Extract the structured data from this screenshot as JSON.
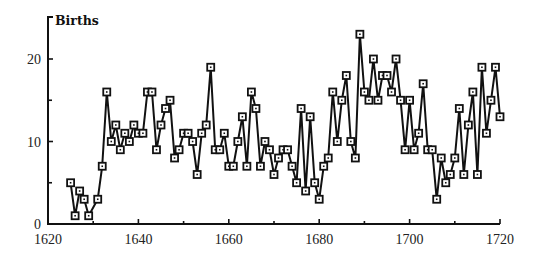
{
  "chart_data": {
    "type": "line",
    "title": "Births",
    "xlabel": "",
    "ylabel": "Births",
    "xlim": [
      1620,
      1720
    ],
    "ylim": [
      0,
      25
    ],
    "x_ticks": [
      1620,
      1640,
      1660,
      1680,
      1700,
      1720
    ],
    "x_minor_ticks": [
      1630,
      1650,
      1670,
      1690,
      1710
    ],
    "y_ticks": [
      0,
      10,
      20
    ],
    "y_minor_ticks": [
      5,
      15
    ],
    "grid": false,
    "legend": null,
    "marker": "square",
    "series": [
      {
        "name": "Births",
        "x": [
          1625,
          1626,
          1627,
          1628,
          1629,
          1631,
          1632,
          1633,
          1634,
          1635,
          1636,
          1637,
          1638,
          1639,
          1640,
          1641,
          1642,
          1643,
          1644,
          1645,
          1646,
          1647,
          1648,
          1649,
          1650,
          1651,
          1652,
          1653,
          1654,
          1655,
          1656,
          1657,
          1658,
          1659,
          1660,
          1661,
          1662,
          1663,
          1664,
          1665,
          1666,
          1667,
          1668,
          1669,
          1670,
          1671,
          1672,
          1673,
          1674,
          1675,
          1676,
          1677,
          1678,
          1679,
          1680,
          1681,
          1682,
          1683,
          1684,
          1685,
          1686,
          1687,
          1688,
          1689,
          1690,
          1691,
          1692,
          1693,
          1694,
          1695,
          1696,
          1697,
          1698,
          1699,
          1700,
          1701,
          1702,
          1703,
          1704,
          1705,
          1706,
          1707,
          1708,
          1709,
          1710,
          1711,
          1712,
          1713,
          1714,
          1715,
          1716,
          1717,
          1718,
          1719,
          1720
        ],
        "values": [
          5,
          1,
          4,
          3,
          1,
          3,
          7,
          16,
          10,
          12,
          9,
          11,
          10,
          12,
          11,
          11,
          16,
          16,
          9,
          12,
          14,
          15,
          8,
          9,
          11,
          11,
          10,
          6,
          11,
          12,
          19,
          9,
          9,
          11,
          7,
          7,
          10,
          13,
          7,
          16,
          14,
          7,
          10,
          9,
          6,
          8,
          9,
          9,
          7,
          5,
          14,
          4,
          13,
          5,
          3,
          7,
          8,
          16,
          10,
          15,
          18,
          10,
          8,
          23,
          16,
          15,
          20,
          15,
          18,
          18,
          16,
          20,
          15,
          9,
          15,
          9,
          11,
          17,
          9,
          9,
          3,
          8,
          5,
          6,
          8,
          14,
          6,
          12,
          16,
          6,
          19,
          11,
          15,
          19,
          13
        ]
      }
    ]
  }
}
